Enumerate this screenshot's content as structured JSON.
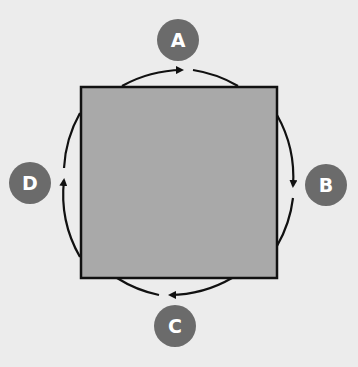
{
  "diagram": {
    "shape": "square",
    "square_fill": "#a9a9a9",
    "square_stroke": "#111111",
    "background": "#ececec",
    "badge_color": "#6b6b6b",
    "arrow_direction": "clockwise",
    "labels": {
      "top": "A",
      "right": "B",
      "bottom": "C",
      "left": "D"
    }
  }
}
